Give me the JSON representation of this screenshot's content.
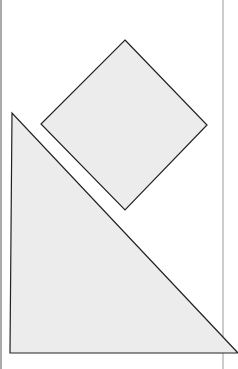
{
  "diagram": {
    "colors": {
      "fill": "#ececec",
      "stroke": "#222222",
      "frame": "#999999",
      "background": "#ffffff"
    },
    "shapes": [
      {
        "name": "diamond-square",
        "points": "125,40 207,125 125,210 41,124"
      },
      {
        "name": "right-triangle",
        "points": "12,113 10,353 238,353"
      }
    ]
  }
}
